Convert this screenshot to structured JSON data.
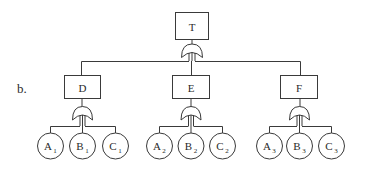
{
  "figure": {
    "panel_label": "b.",
    "type": "fault-tree",
    "top_event": {
      "id": "T",
      "label": "T",
      "gate": "or"
    },
    "intermediate_events": [
      {
        "id": "D",
        "label": "D",
        "gate": "or",
        "children": [
          {
            "id": "A1",
            "base": "A",
            "sub": "1"
          },
          {
            "id": "B1",
            "base": "B",
            "sub": "1"
          },
          {
            "id": "C1",
            "base": "C",
            "sub": "1"
          }
        ]
      },
      {
        "id": "E",
        "label": "E",
        "gate": "or",
        "children": [
          {
            "id": "A2",
            "base": "A",
            "sub": "2"
          },
          {
            "id": "B2",
            "base": "B",
            "sub": "2"
          },
          {
            "id": "C2",
            "base": "C",
            "sub": "2"
          }
        ]
      },
      {
        "id": "F",
        "label": "F",
        "gate": "or",
        "children": [
          {
            "id": "A3",
            "base": "A",
            "sub": "3"
          },
          {
            "id": "B3",
            "base": "B",
            "sub": "3"
          },
          {
            "id": "C3",
            "base": "C",
            "sub": "3"
          }
        ]
      }
    ]
  }
}
